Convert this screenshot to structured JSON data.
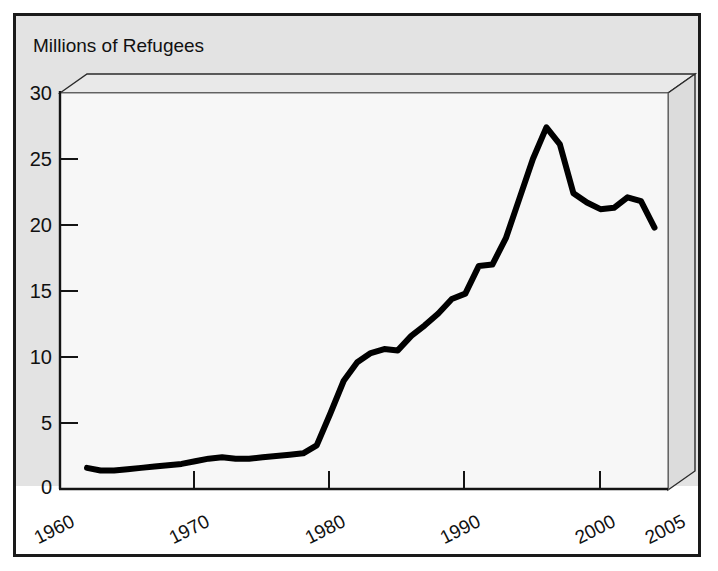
{
  "figure": {
    "title": "Millions of Refugees",
    "frame_color": "#1a1a1a",
    "panel_color": "#e3e3e3",
    "line_color": "#000000",
    "plot_face_color": "#f7f7f7"
  },
  "chart_data": {
    "type": "line",
    "title": "Millions of Refugees",
    "xlabel": "",
    "ylabel": "Millions of Refugees",
    "xlim": [
      1960,
      2005
    ],
    "ylim": [
      0,
      30
    ],
    "grid": false,
    "legend": "none",
    "xticks": [
      "1960",
      "1970",
      "1980",
      "1990",
      "2000",
      "2005"
    ],
    "xtick_values": [
      1960,
      1970,
      1980,
      1990,
      2000,
      2005
    ],
    "yticks": [
      "0",
      "5",
      "10",
      "15",
      "20",
      "25",
      "30"
    ],
    "ytick_values": [
      0,
      5,
      10,
      15,
      20,
      25,
      30
    ],
    "series": [
      {
        "name": "Refugees",
        "x": [
          1962,
          1963,
          1964,
          1965,
          1966,
          1967,
          1968,
          1969,
          1970,
          1971,
          1972,
          1973,
          1974,
          1975,
          1976,
          1977,
          1978,
          1979,
          1980,
          1981,
          1982,
          1983,
          1984,
          1985,
          1986,
          1987,
          1988,
          1989,
          1990,
          1991,
          1992,
          1993,
          1994,
          1995,
          1996,
          1997,
          1998,
          1999,
          2000,
          2001,
          2002,
          2003,
          2004
        ],
        "values": [
          1.6,
          1.4,
          1.4,
          1.5,
          1.6,
          1.7,
          1.8,
          1.9,
          2.1,
          2.3,
          2.4,
          2.3,
          2.3,
          2.4,
          2.5,
          2.6,
          2.7,
          3.3,
          5.7,
          8.2,
          9.6,
          10.3,
          10.6,
          10.5,
          11.6,
          12.4,
          13.3,
          14.4,
          14.8,
          16.9,
          17.0,
          19.0,
          22.0,
          25.0,
          27.4,
          26.1,
          22.4,
          21.7,
          21.2,
          21.3,
          22.1,
          21.8,
          19.8
        ]
      }
    ]
  }
}
